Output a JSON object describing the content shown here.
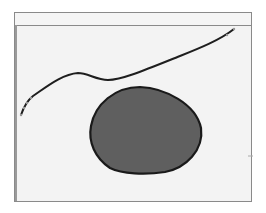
{
  "canvas": {
    "background": "#f3f3f3",
    "frame_color": "#8a8a8a",
    "curve": {
      "stroke": "#1e1e1e",
      "path": "M21,115 C24,106 28,100 33,96 C45,88 62,74 78,73 C88,73 96,80 108,80 C122,80 150,68 180,56 C200,48 220,40 234,29"
    },
    "blob": {
      "fill": "#5f5f5f",
      "stroke": "#1a1a1a",
      "path": "M140,87 C165,88 196,104 201,128 C204,150 186,168 165,172 C145,175 122,174 110,168 C95,158 88,142 91,126 C95,104 115,87 140,87 Z"
    }
  }
}
